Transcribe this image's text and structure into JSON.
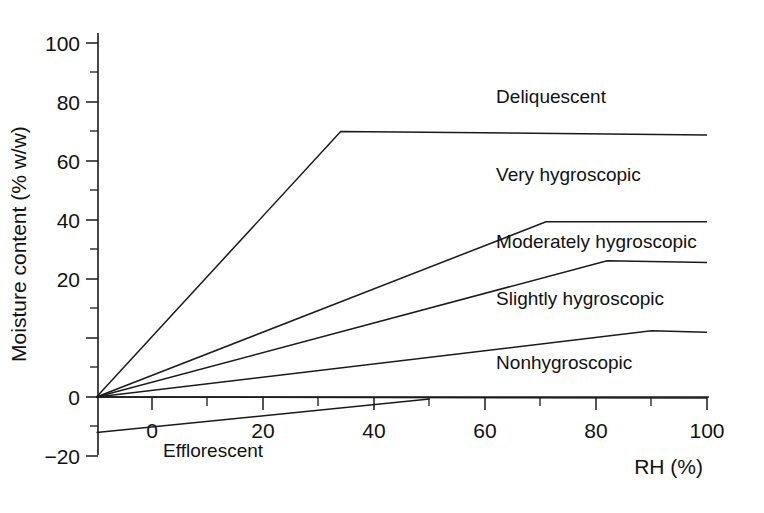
{
  "chart_data": {
    "type": "line",
    "title": "",
    "xlabel": "RH (%)",
    "ylabel": "Moisture content (% w/w)",
    "xlim": [
      -10,
      100
    ],
    "ylim": [
      -20,
      100
    ],
    "xticks": [
      0,
      20,
      40,
      60,
      80,
      100
    ],
    "xtick_labels": [
      "0",
      "20",
      "40",
      "60",
      "80",
      "100"
    ],
    "yticks": [
      -20,
      0,
      20,
      40,
      60,
      80,
      100
    ],
    "ytick_labels": [
      "−20",
      "0",
      "20",
      "40",
      "60",
      "80",
      "100"
    ],
    "minor_ticks": true,
    "grid": false,
    "legend": "inline-annotations",
    "line_color": "#1a1a1a",
    "series": [
      {
        "name": "Deliquescent",
        "label_x": 62,
        "label_y": 83,
        "points": [
          [
            -10,
            0
          ],
          [
            34,
            75
          ],
          [
            100,
            74
          ]
        ]
      },
      {
        "name": "Very hygroscopic",
        "label_x": 62,
        "label_y": 61,
        "points": [
          [
            -10,
            0
          ],
          [
            71,
            49.5
          ],
          [
            100,
            49.5
          ]
        ]
      },
      {
        "name": "Moderately hygroscopic",
        "label_x": 62,
        "label_y": 42,
        "points": [
          [
            -10,
            0
          ],
          [
            82,
            38.5
          ],
          [
            100,
            38
          ]
        ]
      },
      {
        "name": "Slightly hygroscopic",
        "label_x": 62,
        "label_y": 26,
        "points": [
          [
            -10,
            0
          ],
          [
            90,
            18.7
          ],
          [
            100,
            18.3
          ]
        ]
      },
      {
        "name": "Nonhygroscopic",
        "label_x": 62,
        "label_y": 8,
        "points": [
          [
            -10,
            0
          ],
          [
            100,
            -0.3
          ]
        ]
      },
      {
        "name": "Efflorescent",
        "label_x": 2,
        "label_y": -17,
        "points": [
          [
            -10,
            -10
          ],
          [
            50,
            -0.6
          ]
        ]
      }
    ]
  },
  "axes": {
    "y_axis_title": "Moisture content (% w/w)",
    "x_axis_title": "RH (%)",
    "y_labels": [
      "100",
      "80",
      "60",
      "40",
      "20",
      "0",
      "−20"
    ],
    "x_labels": [
      "0",
      "20",
      "40",
      "60",
      "80",
      "100"
    ]
  },
  "annotations": {
    "deliquescent": "Deliquescent",
    "very_hygroscopic": "Very hygroscopic",
    "moderately_hygroscopic": "Moderately hygroscopic",
    "slightly_hygroscopic": "Slightly hygroscopic",
    "nonhygroscopic": "Nonhygroscopic",
    "efflorescent": "Efflorescent"
  }
}
